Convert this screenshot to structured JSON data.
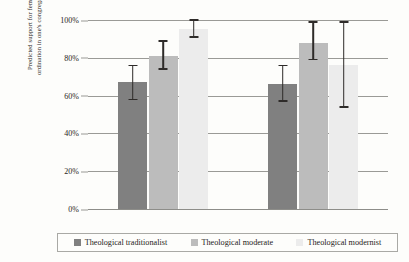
{
  "chart_data": {
    "type": "bar",
    "title": "",
    "xlabel": "",
    "ylabel_line1": "Predicted support for female",
    "ylabel_line2": "ordination in one's congregation",
    "categories": [
      "Female",
      "Male"
    ],
    "ylim": [
      0,
      100
    ],
    "yticks": [
      "0%",
      "20%",
      "40%",
      "60%",
      "80%",
      "100%"
    ],
    "ytick_values": [
      0,
      20,
      40,
      60,
      80,
      100
    ],
    "grid": true,
    "legend_position": "bottom",
    "series": [
      {
        "name": "Theological traditionalist",
        "color": "#808080",
        "values": [
          67,
          66
        ],
        "error_low": [
          58,
          57
        ],
        "error_high": [
          76,
          76
        ]
      },
      {
        "name": "Theological moderate",
        "color": "#bcbcbc",
        "values": [
          81,
          88
        ],
        "error_low": [
          74,
          79
        ],
        "error_high": [
          89,
          99
        ]
      },
      {
        "name": "Theological modernist",
        "color": "#ececec",
        "values": [
          95,
          76
        ],
        "error_low": [
          91,
          54
        ],
        "error_high": [
          100,
          99
        ]
      }
    ]
  }
}
